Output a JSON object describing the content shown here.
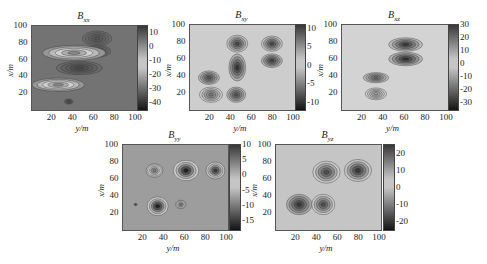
{
  "chart_data": [
    {
      "type": "heatmap",
      "title": "B_xx",
      "title_main": "B",
      "title_sub": "xx",
      "xlabel": "y/m",
      "ylabel": "x/m",
      "xticks": [
        "20",
        "40",
        "60",
        "80",
        "100"
      ],
      "yticks": [
        "20",
        "40",
        "60",
        "80",
        "100"
      ],
      "xlim": [
        0,
        100
      ],
      "ylim": [
        0,
        100
      ],
      "colorbar": {
        "ticks": [
          "10",
          "0",
          "-10",
          "-20",
          "-30",
          "-40"
        ],
        "range": [
          -45,
          15
        ]
      },
      "features": [
        {
          "x": 62,
          "y": 85,
          "rx": 14,
          "ry": 9,
          "value": 10
        },
        {
          "x": 63,
          "y": 70,
          "rx": 12,
          "ry": 7,
          "value": 10
        },
        {
          "x": 40,
          "y": 68,
          "rx": 30,
          "ry": 9,
          "value": -25
        },
        {
          "x": 45,
          "y": 50,
          "rx": 22,
          "ry": 8,
          "value": 12
        },
        {
          "x": 25,
          "y": 30,
          "rx": 25,
          "ry": 8,
          "value": -25
        },
        {
          "x": 35,
          "y": 10,
          "rx": 4,
          "ry": 3,
          "value": 10
        }
      ],
      "background_value": 5
    },
    {
      "type": "heatmap",
      "title": "B_xy",
      "title_main": "B",
      "title_sub": "xy",
      "xlabel": "y/m",
      "ylabel": "x/m",
      "xticks": [
        "20",
        "40",
        "60",
        "80",
        "100"
      ],
      "yticks": [
        "20",
        "40",
        "60",
        "80",
        "100"
      ],
      "xlim": [
        0,
        100
      ],
      "ylim": [
        0,
        100
      ],
      "colorbar": {
        "ticks": [
          "10",
          "5",
          "0",
          "-5",
          "-10"
        ],
        "range": [
          -12,
          11
        ]
      },
      "features": [
        {
          "x": 45,
          "y": 78,
          "rx": 10,
          "ry": 10,
          "value": 10
        },
        {
          "x": 78,
          "y": 78,
          "rx": 10,
          "ry": 9,
          "value": 10
        },
        {
          "x": 45,
          "y": 50,
          "rx": 8,
          "ry": 16,
          "value": -10
        },
        {
          "x": 78,
          "y": 58,
          "rx": 10,
          "ry": 8,
          "value": -9
        },
        {
          "x": 18,
          "y": 38,
          "rx": 10,
          "ry": 8,
          "value": -8
        },
        {
          "x": 20,
          "y": 18,
          "rx": 11,
          "ry": 9,
          "value": 7
        },
        {
          "x": 44,
          "y": 18,
          "rx": 9,
          "ry": 9,
          "value": -8
        }
      ],
      "background_value": 0
    },
    {
      "type": "heatmap",
      "title": "B_xz",
      "title_main": "B",
      "title_sub": "xz",
      "xlabel": "y/m",
      "ylabel": "x/m",
      "xticks": [
        "20",
        "40",
        "60",
        "80",
        "100"
      ],
      "yticks": [
        "20",
        "40",
        "60",
        "80",
        "100"
      ],
      "xlim": [
        0,
        100
      ],
      "ylim": [
        0,
        100
      ],
      "colorbar": {
        "ticks": [
          "30",
          "20",
          "10",
          "0",
          "-10",
          "-20",
          "-30"
        ],
        "range": [
          -35,
          30
        ]
      },
      "features": [
        {
          "x": 60,
          "y": 77,
          "rx": 16,
          "ry": 8,
          "value": 30
        },
        {
          "x": 60,
          "y": 60,
          "rx": 16,
          "ry": 8,
          "value": -30
        },
        {
          "x": 32,
          "y": 38,
          "rx": 12,
          "ry": 6,
          "value": -20
        },
        {
          "x": 32,
          "y": 19,
          "rx": 10,
          "ry": 7,
          "value": 12
        }
      ],
      "background_value": 0
    },
    {
      "type": "heatmap",
      "title": "B_yy",
      "title_main": "B",
      "title_sub": "yy",
      "xlabel": "y/m",
      "ylabel": "x/m",
      "xticks": [
        "20",
        "40",
        "60",
        "80",
        "100"
      ],
      "yticks": [
        "20",
        "40",
        "60",
        "80",
        "100"
      ],
      "xlim": [
        0,
        100
      ],
      "ylim": [
        0,
        100
      ],
      "colorbar": {
        "ticks": [
          "10",
          "5",
          "0",
          "-5",
          "-10",
          "-15"
        ],
        "range": [
          -18,
          10
        ]
      },
      "features": [
        {
          "x": 30,
          "y": 70,
          "rx": 8,
          "ry": 8,
          "value": -10
        },
        {
          "x": 60,
          "y": 70,
          "rx": 12,
          "ry": 12,
          "value": -17
        },
        {
          "x": 88,
          "y": 70,
          "rx": 9,
          "ry": 10,
          "value": -15
        },
        {
          "x": 33,
          "y": 28,
          "rx": 10,
          "ry": 11,
          "value": -17
        },
        {
          "x": 55,
          "y": 30,
          "rx": 5,
          "ry": 5,
          "value": -10
        },
        {
          "x": 12,
          "y": 30,
          "rx": 1.5,
          "ry": 1.5,
          "value": -15
        }
      ],
      "background_value": 2
    },
    {
      "type": "heatmap",
      "title": "B_yz",
      "title_main": "B",
      "title_sub": "yz",
      "xlabel": "y/m",
      "ylabel": "x/m",
      "xticks": [
        "20",
        "40",
        "60",
        "80",
        "100"
      ],
      "yticks": [
        "20",
        "40",
        "60",
        "80",
        "100"
      ],
      "xlim": [
        0,
        100
      ],
      "ylim": [
        0,
        100
      ],
      "colorbar": {
        "ticks": [
          "20",
          "10",
          "0",
          "-10",
          "-20"
        ],
        "range": [
          -25,
          25
        ]
      },
      "features": [
        {
          "x": 48,
          "y": 68,
          "rx": 13,
          "ry": 13,
          "value": 22
        },
        {
          "x": 78,
          "y": 70,
          "rx": 13,
          "ry": 13,
          "value": 25
        },
        {
          "x": 22,
          "y": 30,
          "rx": 12,
          "ry": 12,
          "value": -20
        },
        {
          "x": 45,
          "y": 30,
          "rx": 11,
          "ry": 12,
          "value": 22
        }
      ],
      "background_value": 0
    }
  ],
  "layout": {
    "panels": [
      {
        "x": 31,
        "y": 25,
        "w": 105,
        "h": 84,
        "cb_x": 137,
        "cb_w": 9
      },
      {
        "x": 189,
        "y": 24,
        "w": 105,
        "h": 85,
        "cb_x": 295,
        "cb_w": 9
      },
      {
        "x": 341,
        "y": 24,
        "w": 106,
        "h": 85,
        "cb_x": 448,
        "cb_w": 9
      },
      {
        "x": 122,
        "y": 144,
        "w": 105,
        "h": 85,
        "cb_x": 229,
        "cb_w": 10
      },
      {
        "x": 275,
        "y": 144,
        "w": 105,
        "h": 85,
        "cb_x": 383,
        "cb_w": 10
      }
    ]
  }
}
